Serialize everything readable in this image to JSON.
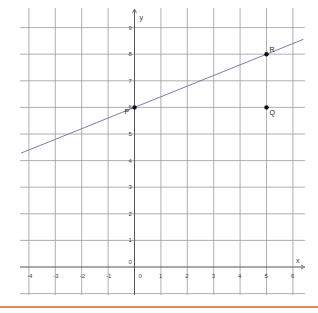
{
  "chart_data": {
    "type": "scatter",
    "title": "",
    "xlabel": "x",
    "ylabel": "y",
    "xlim": [
      -4.3,
      6.4
    ],
    "ylim": [
      -1,
      9.5
    ],
    "grid": true,
    "x_ticks": [
      "-4",
      "-3",
      "-2",
      "-1",
      "0",
      "1",
      "2",
      "3",
      "4",
      "5",
      "6"
    ],
    "y_ticks": [
      "0",
      "1",
      "2",
      "3",
      "4",
      "5",
      "6",
      "7",
      "8",
      "9"
    ],
    "points": [
      {
        "label": "P",
        "x": 0,
        "y": 6
      },
      {
        "label": "R",
        "x": 5,
        "y": 8
      },
      {
        "label": "Q",
        "x": 5,
        "y": 6
      }
    ],
    "lines": [
      {
        "name": "line PR",
        "through": [
          [
            0,
            6
          ],
          [
            5,
            8
          ]
        ],
        "slope": 0.4,
        "intercept": 6,
        "color": "#6a6fa0"
      }
    ],
    "colors": {
      "grid": "#9a9a9a",
      "axis": "#555555",
      "line": "#6a6fa0",
      "bottom_rule": "#e08a5a"
    }
  }
}
